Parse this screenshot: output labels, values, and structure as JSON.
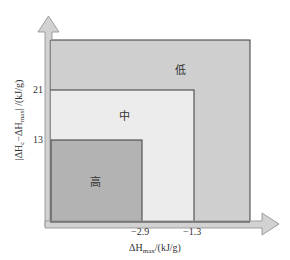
{
  "diagram": {
    "type": "nested-region risk diagram",
    "y_axis": {
      "label_prefix": "|ΔH",
      "label_sub1": "c",
      "label_mid": "−ΔH",
      "label_sub2": "max",
      "label_suffix": "| /(kJ/g)",
      "ticks": [
        "21",
        "13"
      ]
    },
    "x_axis": {
      "label_prefix": "ΔH",
      "label_sub": "max",
      "label_suffix": "/(kJ/g)",
      "ticks": [
        "−2.9",
        "−1.3"
      ]
    },
    "zones": [
      {
        "label": "低",
        "meaning": "low",
        "color": "#cfcfcf"
      },
      {
        "label": "中",
        "meaning": "medium",
        "color": "#ececec"
      },
      {
        "label": "高",
        "meaning": "high",
        "color": "#b3b3b3"
      }
    ],
    "colors": {
      "axis_arrow_fill": "#d2d2d2",
      "axis_arrow_stroke": "#8a8a8a",
      "border": "#3a3a3a"
    }
  }
}
